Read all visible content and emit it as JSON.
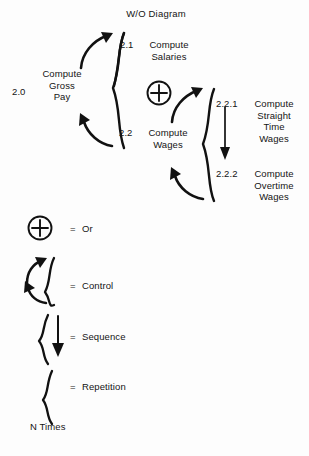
{
  "diagram": {
    "title": "W/O Diagram",
    "nodes": [
      {
        "id": "2.0",
        "number": "2.0",
        "label": "Compute\nGross\nPay"
      },
      {
        "id": "2.1",
        "number": "2.1",
        "label": "Compute\nSalaries"
      },
      {
        "id": "2.2",
        "number": "2.2",
        "label": "Compute\nWages"
      },
      {
        "id": "2.2.1",
        "number": "2.2.1",
        "label": "Compute\nStraight\nTime\nWages"
      },
      {
        "id": "2.2.2",
        "number": "2.2.2",
        "label": "Compute\nOvertime\nWages"
      }
    ],
    "or_symbol": "+"
  },
  "legend": {
    "items": [
      {
        "symbol": "or-circle",
        "equals": "=",
        "label": "Or"
      },
      {
        "symbol": "control-brace",
        "equals": "=",
        "label": "Control"
      },
      {
        "symbol": "sequence-brace",
        "equals": "=",
        "label": "Sequence"
      },
      {
        "symbol": "repetition-brace",
        "equals": "=",
        "label": "Repetition"
      }
    ],
    "footnote": "N Times"
  },
  "style": {
    "ink": "#111111",
    "paper": "#fdfdfd"
  }
}
